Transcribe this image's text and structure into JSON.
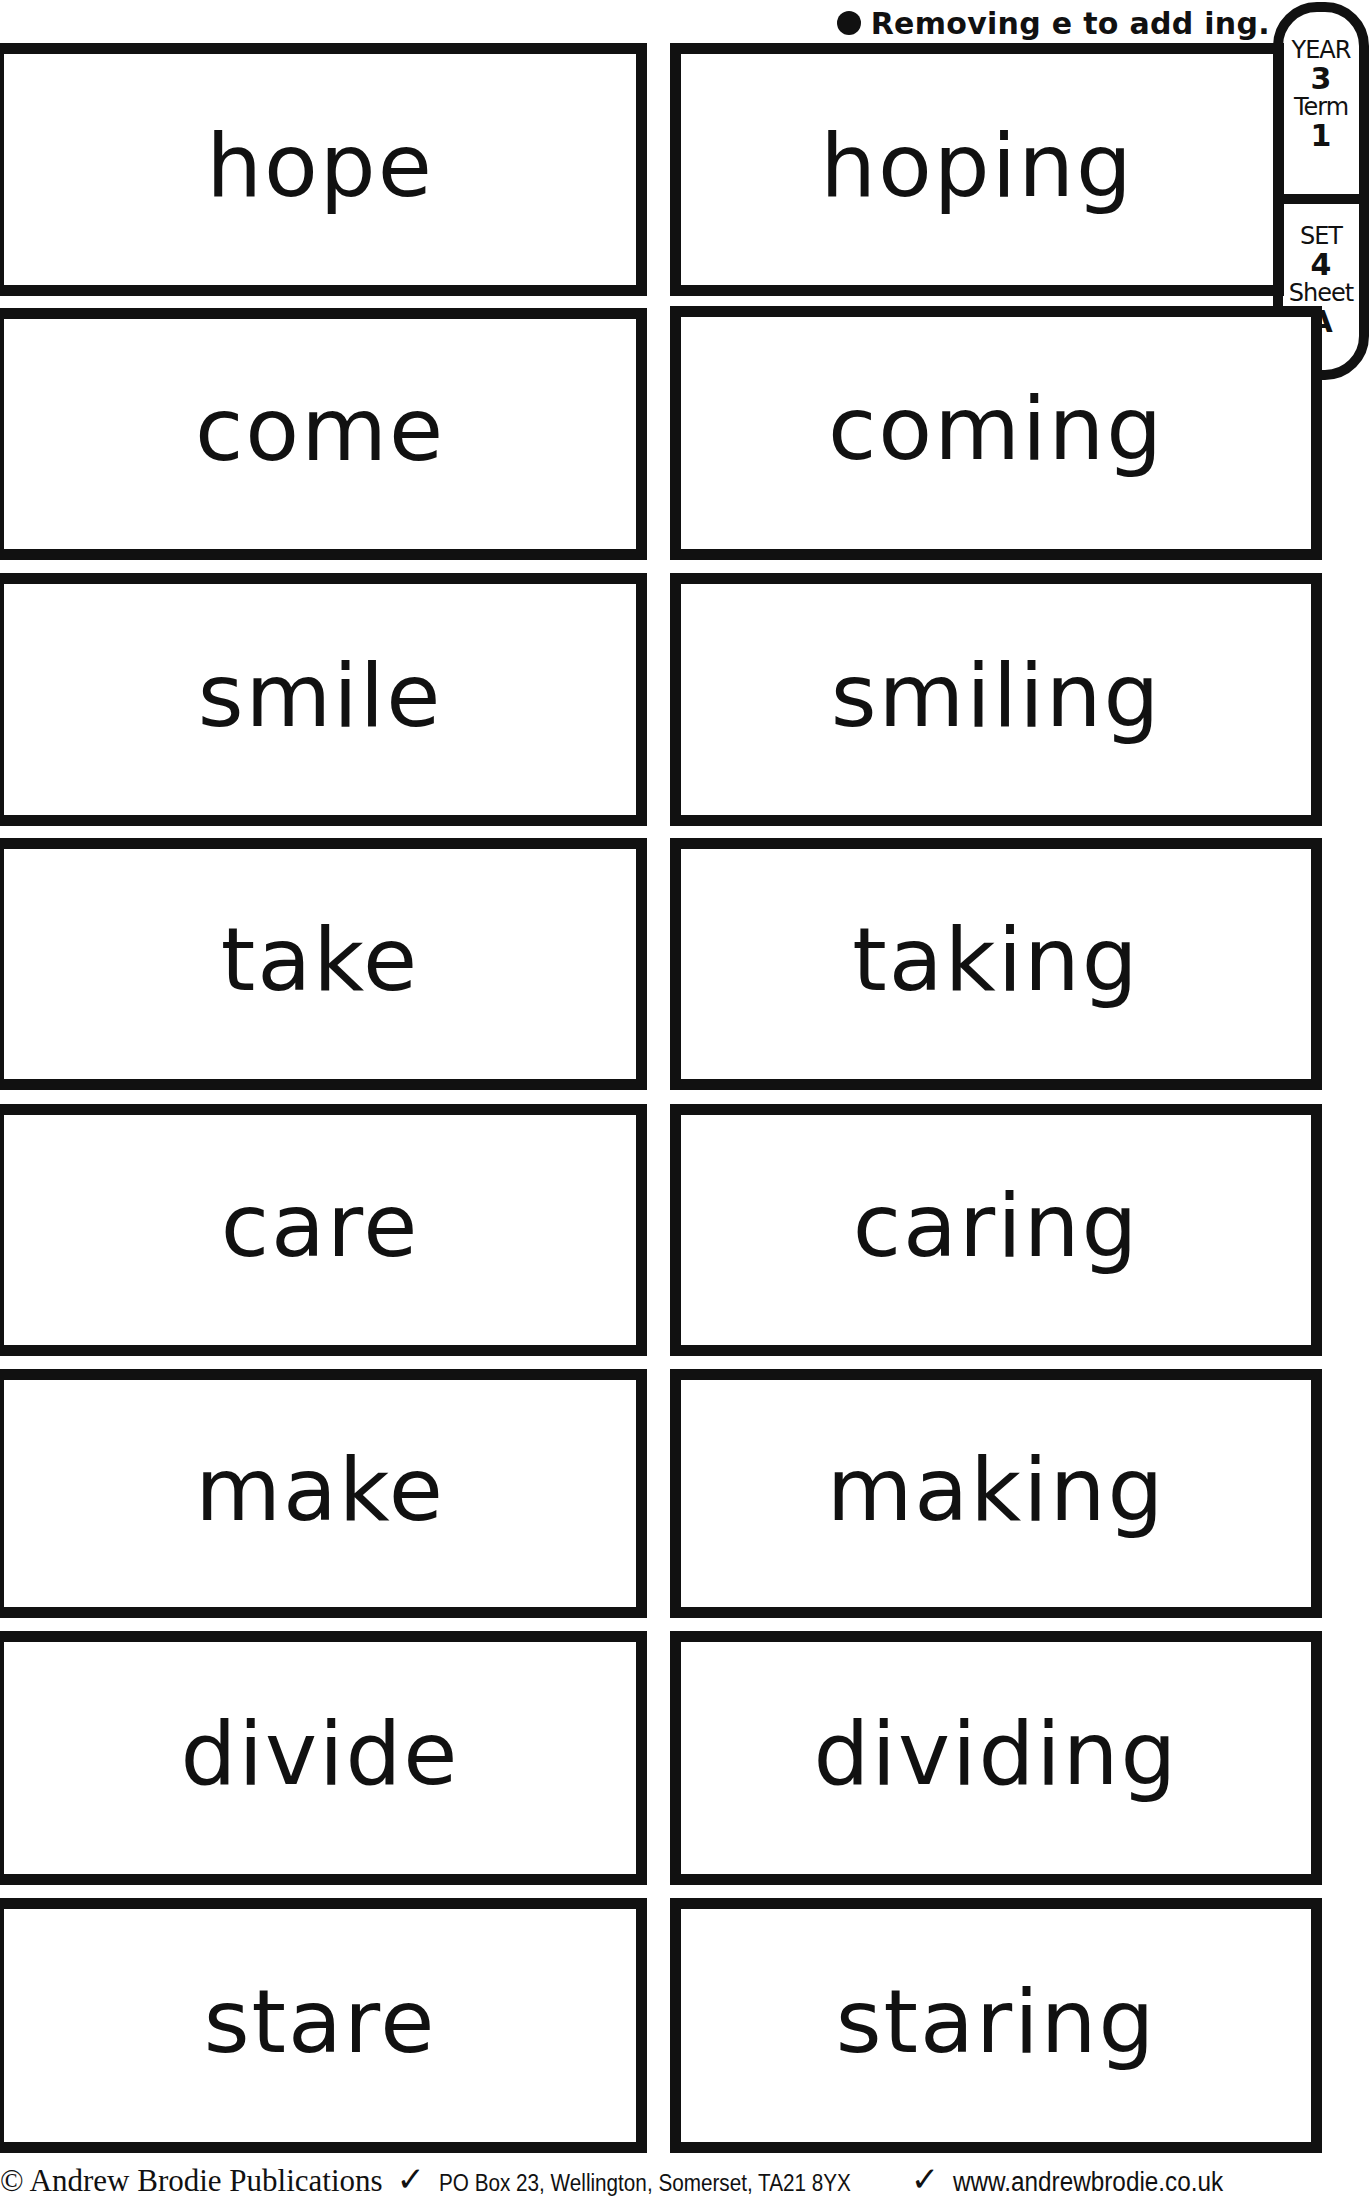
{
  "header": {
    "bullet_icon": "bullet-icon",
    "title": "Removing e to add ing."
  },
  "tab": {
    "year_label": "YEAR",
    "year_value": "3",
    "term_label": "Term",
    "term_value": "1",
    "set_label": "SET",
    "set_value": "4",
    "sheet_label": "Sheet",
    "sheet_value": "A"
  },
  "cards": {
    "left": [
      "hope",
      "come",
      "smile",
      "take",
      "care",
      "make",
      "divide",
      "stare"
    ],
    "right": [
      "hoping",
      "coming",
      "smiling",
      "taking",
      "caring",
      "making",
      "dividing",
      "staring"
    ]
  },
  "footer": {
    "publisher": "© Andrew Brodie Publications",
    "separator_icon": "tick-icon",
    "separator": "✓",
    "address": "PO Box 23, Wellington, Somerset, TA21 8YX",
    "website": "www.andrewbrodie.co.uk"
  }
}
